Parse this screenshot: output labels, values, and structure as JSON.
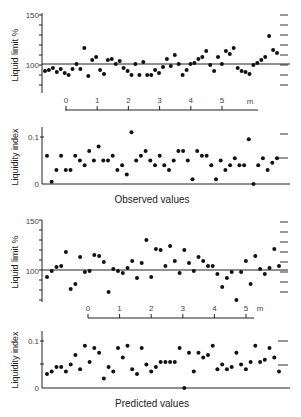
{
  "figure": {
    "caption_observed": "Observed values",
    "caption_predicted": "Predicted values",
    "scale_unit": "m",
    "scale_ticks": [
      "0",
      "1",
      "2",
      "3",
      "4",
      "5"
    ]
  },
  "chart_data": [
    {
      "type": "scatter",
      "title": "Observed values — Liquid limit",
      "ylabel": "Liquid limit %",
      "ylim": [
        75,
        150
      ],
      "yticks": [
        "150",
        "100"
      ],
      "reference_line": 100,
      "x": [
        1,
        2,
        3,
        4,
        5,
        6,
        7,
        8,
        9,
        10,
        11,
        12,
        13,
        14,
        15,
        16,
        17,
        18,
        19,
        20,
        21,
        22,
        23,
        24,
        25,
        26,
        27,
        28,
        29,
        30,
        31,
        32,
        33,
        34,
        35,
        36,
        37,
        38,
        39,
        40,
        41,
        42,
        43,
        44,
        45,
        46,
        47,
        48,
        49,
        50,
        51,
        52,
        53,
        54,
        55,
        56,
        57,
        58,
        59,
        60
      ],
      "values": [
        93,
        94,
        96,
        92,
        95,
        91,
        89,
        95,
        100,
        95,
        116,
        88,
        104,
        107,
        94,
        90,
        104,
        105,
        100,
        103,
        96,
        93,
        89,
        100,
        89,
        102,
        89,
        89,
        94,
        91,
        97,
        105,
        98,
        109,
        100,
        89,
        94,
        100,
        101,
        105,
        107,
        113,
        99,
        93,
        107,
        100,
        113,
        110,
        116,
        96,
        93,
        92,
        90,
        99,
        101,
        104,
        107,
        128,
        114,
        111
      ]
    },
    {
      "type": "scatter",
      "title": "Observed values — Liquidity index",
      "ylabel": "Liquidity index",
      "ylim": [
        0,
        0.12
      ],
      "yticks": [
        "0.1",
        "0"
      ],
      "values": [
        0.06,
        0.005,
        0.03,
        0.06,
        0.03,
        0.03,
        0.06,
        0.05,
        0.04,
        0.07,
        0.05,
        0.08,
        0.05,
        0.05,
        0.06,
        0.03,
        0.04,
        0.02,
        0.11,
        0.05,
        0.06,
        0.07,
        0.05,
        0.04,
        0.06,
        0.04,
        0.03,
        0.05,
        0.07,
        0.07,
        0.05,
        0.01,
        0.07,
        0.06,
        0.06,
        0.04,
        0.01,
        0.05,
        0.03,
        0.04,
        0.055,
        0.04,
        0.04,
        0.095,
        0.0,
        0.04,
        0.055,
        0.03,
        0.045,
        0.055
      ]
    },
    {
      "type": "scatter",
      "title": "Predicted values — Liquid limit",
      "ylabel": "Liquid limit %",
      "ylim": [
        75,
        150
      ],
      "yticks": [
        "150",
        "100"
      ],
      "reference_line": 100,
      "values": [
        93,
        99,
        103,
        104,
        118,
        81,
        86,
        113,
        98,
        99,
        115,
        114,
        108,
        78,
        101,
        99,
        97,
        102,
        109,
        92,
        107,
        130,
        93,
        121,
        120,
        104,
        124,
        109,
        97,
        120,
        107,
        99,
        113,
        109,
        104,
        104,
        96,
        83,
        92,
        98,
        70,
        98,
        109,
        86,
        114,
        101,
        96,
        102,
        121,
        104
      ]
    },
    {
      "type": "scatter",
      "title": "Predicted values — Liquidity index",
      "ylabel": "Liquidity index",
      "ylim": [
        0,
        0.12
      ],
      "yticks": [
        "0.1",
        "0"
      ],
      "values": [
        0.03,
        0.035,
        0.045,
        0.045,
        0.035,
        0.05,
        0.07,
        0.04,
        0.09,
        0.055,
        0.085,
        0.075,
        0.02,
        0.045,
        0.035,
        0.085,
        0.065,
        0.09,
        0.04,
        0.03,
        0.085,
        0.05,
        0.035,
        0.045,
        0.055,
        0.055,
        0.055,
        0.055,
        0.085,
        0.0,
        0.075,
        0.035,
        0.075,
        0.065,
        0.07,
        0.09,
        0.04,
        0.05,
        0.04,
        0.045,
        0.075,
        0.05,
        0.04,
        0.055,
        0.09,
        0.055,
        0.06,
        0.085,
        0.065,
        0.035
      ]
    }
  ]
}
